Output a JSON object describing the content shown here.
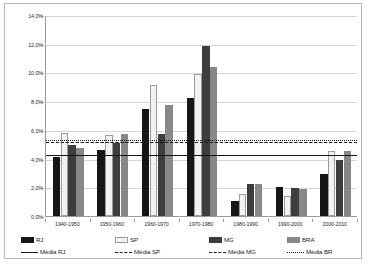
{
  "chart_data": {
    "type": "bar",
    "title": "",
    "xlabel": "",
    "ylabel": "",
    "ylim": [
      0.0,
      14.0
    ],
    "ytick_labels": [
      "0,0%",
      "2,0%",
      "4,0%",
      "6,0%",
      "8,0%",
      "10,0%",
      "12,0%",
      "14,0%"
    ],
    "ytick_values": [
      0.0,
      2.0,
      4.0,
      6.0,
      8.0,
      10.0,
      12.0,
      14.0
    ],
    "grid": true,
    "legend_position": "bottom",
    "categories": [
      "1940-1950",
      "1950-1960",
      "1960-1970",
      "1970-1980",
      "1980-1990",
      "1990-2000",
      "2000-2010"
    ],
    "series": [
      {
        "name": "RJ",
        "color": "#161616",
        "values": [
          4.1,
          4.6,
          7.45,
          8.25,
          1.05,
          2.0,
          2.95
        ]
      },
      {
        "name": "SP",
        "color": "#f2f2f2",
        "values": [
          5.8,
          5.65,
          9.1,
          9.9,
          1.5,
          1.4,
          4.5
        ]
      },
      {
        "name": "MG",
        "color": "#3d3d3d",
        "values": [
          4.95,
          5.1,
          5.7,
          11.85,
          2.25,
          1.95,
          3.9
        ]
      },
      {
        "name": "BRA",
        "color": "#888888",
        "values": [
          4.75,
          5.7,
          7.75,
          10.4,
          2.2,
          1.85,
          4.5
        ]
      }
    ],
    "mean_lines": [
      {
        "name": "Média RJ",
        "value": 4.3,
        "style": "solid",
        "color": "#111111"
      },
      {
        "name": "Média SP",
        "value": 5.25,
        "style": "dashed",
        "color": "#1a1a1a"
      },
      {
        "name": "Média MG",
        "value": 5.2,
        "style": "dashdot",
        "color": "#1a1a1a"
      },
      {
        "name": "Média BR",
        "value": 5.35,
        "style": "dotted",
        "color": "#111111"
      }
    ]
  },
  "legend": {
    "bars": [
      {
        "label": "RJ",
        "key": "rj"
      },
      {
        "label": "SP",
        "key": "sp"
      },
      {
        "label": "MG",
        "key": "mg"
      },
      {
        "label": "BRA",
        "key": "bra"
      }
    ],
    "lines": [
      {
        "label": "Média RJ",
        "style": "solid"
      },
      {
        "label": "Média SP",
        "style": "dashed"
      },
      {
        "label": "Média MG",
        "style": "dashdot"
      },
      {
        "label": "Média BR",
        "style": "dotted"
      }
    ]
  }
}
